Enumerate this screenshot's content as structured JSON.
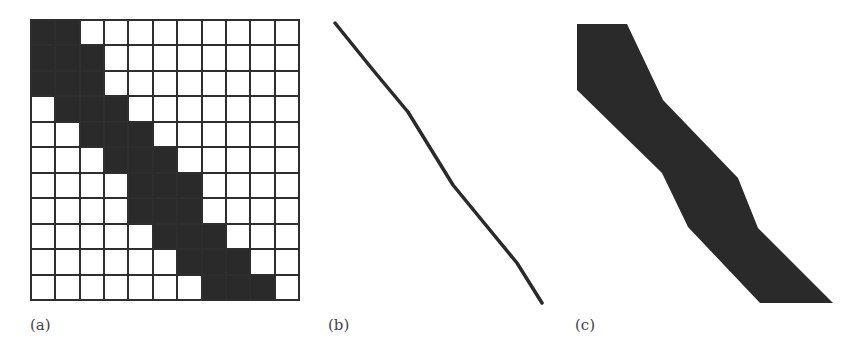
{
  "figure": {
    "panels": [
      {
        "id": "a",
        "label": "(a)",
        "type": "pixel-grid",
        "rows": 11,
        "cols": 11,
        "filled_ranges_per_row": [
          [
            0,
            1
          ],
          [
            0,
            2
          ],
          [
            0,
            2
          ],
          [
            1,
            3
          ],
          [
            2,
            4
          ],
          [
            3,
            5
          ],
          [
            4,
            6
          ],
          [
            4,
            6
          ],
          [
            5,
            7
          ],
          [
            6,
            8
          ],
          [
            7,
            9
          ]
        ]
      },
      {
        "id": "b",
        "label": "(b)",
        "type": "polyline",
        "points": [
          [
            335,
            23
          ],
          [
            373,
            70
          ],
          [
            408,
            112
          ],
          [
            453,
            185
          ],
          [
            517,
            263
          ],
          [
            542,
            303
          ]
        ]
      },
      {
        "id": "c",
        "label": "(c)",
        "type": "polygon",
        "points": [
          [
            577,
            24
          ],
          [
            627,
            24
          ],
          [
            663,
            100
          ],
          [
            738,
            178
          ],
          [
            758,
            228
          ],
          [
            833,
            303
          ],
          [
            760,
            303
          ],
          [
            688,
            227
          ],
          [
            662,
            173
          ],
          [
            577,
            90
          ]
        ]
      }
    ],
    "colors": {
      "ink": "#2a2a2a",
      "grid_line": "#2e2e2e",
      "background": "#ffffff",
      "label": "#444444"
    }
  }
}
